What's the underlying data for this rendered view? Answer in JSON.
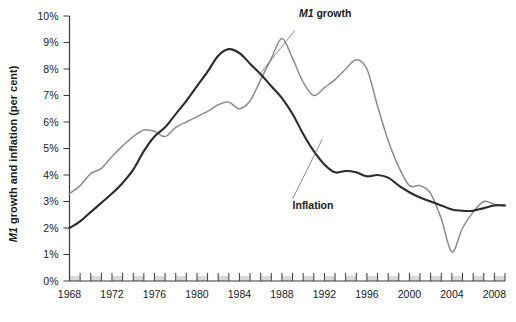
{
  "chart_data": {
    "type": "line",
    "title": "",
    "xlabel": "",
    "ylabel": "M1 growth and inflation (per cent)",
    "ylabel_parts": {
      "italic": "M1",
      "rest": " growth and inflation (per cent)"
    },
    "ylim": [
      0,
      10
    ],
    "xlim": [
      1968,
      2009
    ],
    "ytick_labels": [
      "0%",
      "1%",
      "2%",
      "3%",
      "4%",
      "5%",
      "6%",
      "7%",
      "8%",
      "9%",
      "10%"
    ],
    "ytick_values": [
      0,
      1,
      2,
      3,
      4,
      5,
      6,
      7,
      8,
      9,
      10
    ],
    "xtick_labels": [
      "1968",
      "1972",
      "1976",
      "1980",
      "1984",
      "1988",
      "1992",
      "1996",
      "2000",
      "2004",
      "2008"
    ],
    "xtick_values": [
      1968,
      1972,
      1976,
      1980,
      1984,
      1988,
      1992,
      1996,
      2000,
      2004,
      2008
    ],
    "x_minor_step": 1,
    "grid": false,
    "legend": "annotations",
    "annotations": [
      {
        "id": "m1-growth-label",
        "text": "M1 growth",
        "italic_prefix": "M1",
        "rest": " growth",
        "x": 1989.6,
        "y": 9.95
      },
      {
        "id": "inflation-label",
        "text": "Inflation",
        "x": 1989.0,
        "y": 2.72
      }
    ],
    "series": [
      {
        "name": "M1 growth",
        "color": "#8c8c8c",
        "x": [
          1968,
          1969,
          1970,
          1971,
          1972,
          1973,
          1974,
          1975,
          1976,
          1977,
          1978,
          1979,
          1980,
          1981,
          1982,
          1983,
          1984,
          1985,
          1986,
          1987,
          1988,
          1989,
          1990,
          1991,
          1992,
          1993,
          1994,
          1995,
          1996,
          1997,
          1998,
          1999,
          2000,
          2001,
          2002,
          2003,
          2004,
          2005,
          2006,
          2007,
          2008,
          2009
        ],
        "values": [
          3.3,
          3.6,
          4.05,
          4.25,
          4.7,
          5.1,
          5.45,
          5.7,
          5.65,
          5.45,
          5.8,
          6.0,
          6.2,
          6.4,
          6.65,
          6.75,
          6.5,
          6.8,
          7.6,
          8.4,
          9.15,
          8.4,
          7.5,
          7.0,
          7.3,
          7.6,
          8.0,
          8.35,
          8.0,
          6.6,
          5.3,
          4.3,
          3.6,
          3.6,
          3.3,
          2.35,
          1.1,
          2.0,
          2.6,
          3.0,
          2.9,
          2.85
        ]
      },
      {
        "name": "Inflation",
        "color": "#2b2b2b",
        "x": [
          1968,
          1969,
          1970,
          1971,
          1972,
          1973,
          1974,
          1975,
          1976,
          1977,
          1978,
          1979,
          1980,
          1981,
          1982,
          1983,
          1984,
          1985,
          1986,
          1987,
          1988,
          1989,
          1990,
          1991,
          1992,
          1993,
          1994,
          1995,
          1996,
          1997,
          1998,
          1999,
          2000,
          2001,
          2002,
          2003,
          2004,
          2005,
          2006,
          2007,
          2008,
          2009
        ],
        "values": [
          2.0,
          2.25,
          2.6,
          2.95,
          3.3,
          3.7,
          4.2,
          4.9,
          5.45,
          5.8,
          6.3,
          6.8,
          7.35,
          7.9,
          8.5,
          8.75,
          8.6,
          8.2,
          7.8,
          7.35,
          6.9,
          6.3,
          5.55,
          4.9,
          4.4,
          4.1,
          4.15,
          4.1,
          3.95,
          4.0,
          3.9,
          3.6,
          3.35,
          3.15,
          3.0,
          2.85,
          2.7,
          2.65,
          2.65,
          2.75,
          2.85,
          2.85
        ]
      }
    ]
  }
}
